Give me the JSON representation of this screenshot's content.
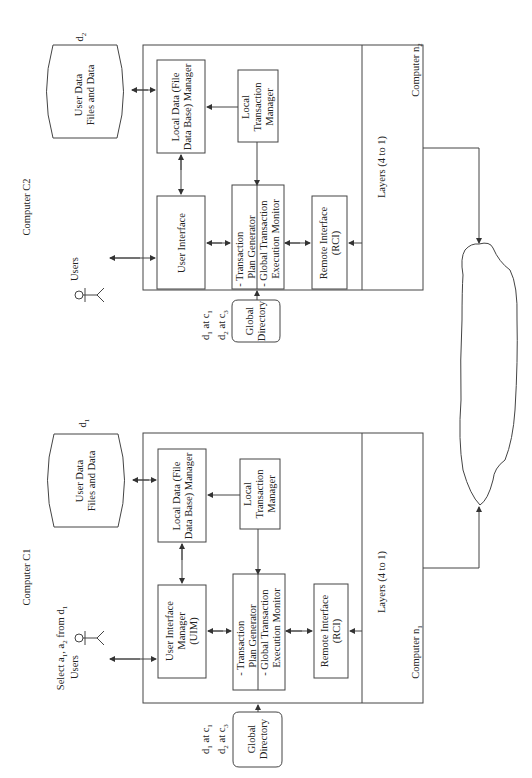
{
  "computers": [
    {
      "id": "c2",
      "title": "Computer C2",
      "node_label": "Computer n",
      "node_sub": "2",
      "data_store": {
        "label_line1": "User Data",
        "label_line2": "Files and Data",
        "tag": "d",
        "tag_sub": "2"
      },
      "users_label": "Users",
      "query": null,
      "user_interface": {
        "line1": "User Interface",
        "line2": "",
        "line3": ""
      },
      "local_data_manager": {
        "line1": "Local Data (File",
        "line2": "Data Base) Manager"
      },
      "local_transaction_manager": {
        "line1": "Local",
        "line2": "Transaction",
        "line3": "Manager"
      },
      "transaction_box": {
        "line1": "- Transaction",
        "line2": "Plan Generator",
        "line3": "- Global Transaction",
        "line4": "Execution Monitor"
      },
      "remote_interface": {
        "line1": "Remote Interface",
        "line2": "(RCI)"
      },
      "layers": "Layers (4 to 1)",
      "global_directory": {
        "line1": "Global",
        "line2": "Directory",
        "entries": [
          {
            "d": "d",
            "ds": "1",
            "at": " at c",
            "cs": "1"
          },
          {
            "d": "d",
            "ds": "2",
            "at": " at c",
            "cs": "3"
          }
        ]
      }
    },
    {
      "id": "c1",
      "title": "Computer C1",
      "node_label": "Computer n",
      "node_sub": "1",
      "data_store": {
        "label_line1": "User Data",
        "label_line2": "Files and Data",
        "tag": "d",
        "tag_sub": "1"
      },
      "users_label": "Users",
      "query": {
        "pre": "Select a",
        "s1": "1",
        "mid": ", a",
        "s2": "2",
        "post": " from d",
        "s3": "1"
      },
      "user_interface": {
        "line1": "User Interface",
        "line2": "Manager",
        "line3": "(UIM)"
      },
      "local_data_manager": {
        "line1": "Local Data (File",
        "line2": "Data Base) Manager"
      },
      "local_transaction_manager": {
        "line1": "Local",
        "line2": "Transaction",
        "line3": "Manager"
      },
      "transaction_box": {
        "line1": "- Transaction",
        "line2": "Plan Generator",
        "line3": "- Global Transaction",
        "line4": "Execution Monitor"
      },
      "remote_interface": {
        "line1": "Remote Interface",
        "line2": "(RCI)"
      },
      "layers": "Layers (4 to 1)",
      "global_directory": {
        "line1": "Global",
        "line2": "Directory",
        "entries": [
          {
            "d": "d",
            "ds": "1",
            "at": " at c",
            "cs": "1"
          },
          {
            "d": "d",
            "ds": "2",
            "at": " at c",
            "cs": "3"
          }
        ]
      }
    }
  ],
  "network": {
    "shape": "cloud"
  },
  "colors": {
    "line": "#444444",
    "text": "#222222",
    "background": "#ffffff"
  }
}
